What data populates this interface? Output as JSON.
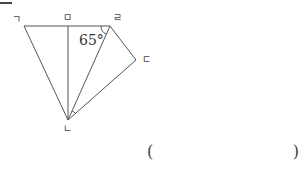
{
  "figure": {
    "vertices": {
      "giyeok": {
        "label": "ㄱ",
        "x": 24,
        "y": 26
      },
      "mieum": {
        "label": "ㅁ",
        "x": 68,
        "y": 26
      },
      "rieul": {
        "label": "ㄹ",
        "x": 110,
        "y": 26
      },
      "digeut": {
        "label": "ㄷ",
        "x": 136,
        "y": 60
      },
      "nieun": {
        "label": "ㄴ",
        "x": 68,
        "y": 120
      }
    },
    "angle_label": "65°",
    "stroke_color": "#555555"
  },
  "answer": {
    "open_paren": "(",
    "close_paren": ")",
    "value": ""
  }
}
